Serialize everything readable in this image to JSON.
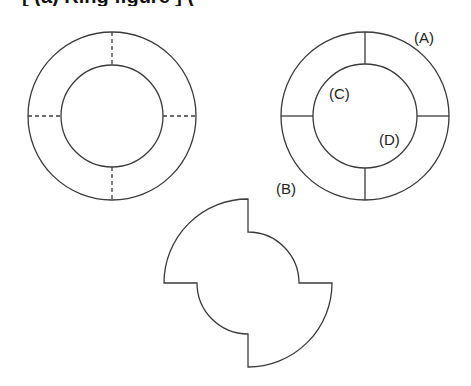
{
  "header": {
    "clipped_text": "[ (a) Ring figure ] ( "
  },
  "diagram": {
    "stroke_color": "#3a3a3a",
    "left_ring": {
      "center": [
        112,
        116
      ],
      "outer_radius": 84,
      "inner_radius": 51,
      "divider_style": "dashed",
      "dividers": [
        "top",
        "right",
        "bottom",
        "left"
      ]
    },
    "right_ring": {
      "center": [
        365,
        116
      ],
      "outer_radius": 84,
      "inner_radius": 52,
      "divider_style": "solid",
      "labels": {
        "A": "(A)",
        "B": "(B)",
        "C": "(C)",
        "D": "(D)"
      }
    },
    "pinwheel_shape": {
      "center": [
        248,
        283
      ],
      "outer_radius": 84,
      "inner_radius": 51,
      "description": "Ring with top-left and bottom-right quadrants at outer radius; top-right and bottom-left quadrants cut to inner radius"
    }
  }
}
